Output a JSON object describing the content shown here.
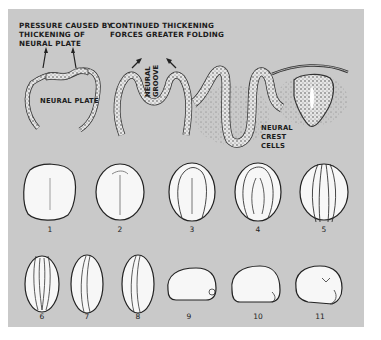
{
  "figure": {
    "background_color": "#c9c9c9",
    "top_row": {
      "panels": [
        {
          "caption": "PRESSURE CAUSED BY\nTHICKENING OF\nNEURAL PLATE",
          "inner_label": "NEURAL PLATE"
        },
        {
          "caption": "CONTINUED THICKENING\nFORCES GREATER FOLDING",
          "inner_label": "NEURAL\nGROOVE"
        },
        {
          "caption": "",
          "inner_label": "NEURAL\nCREST\nCELLS"
        },
        {
          "caption": "",
          "inner_label": ""
        }
      ]
    },
    "embryo_stages": {
      "row1": [
        "1",
        "2",
        "3",
        "4",
        "5"
      ],
      "row2": [
        "6",
        "7",
        "8",
        "9",
        "10",
        "11"
      ]
    }
  }
}
